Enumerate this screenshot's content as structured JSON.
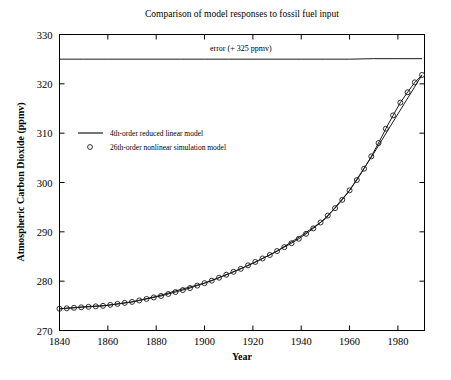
{
  "chart_data": {
    "type": "line",
    "title": "Comparison of model responses to fossil fuel input",
    "xlabel": "Year",
    "ylabel": "Atmospheric Carbon Dioxide (ppmv)",
    "xlim": [
      1840,
      1991
    ],
    "ylim": [
      270,
      330
    ],
    "xticks": [
      1840,
      1860,
      1880,
      1900,
      1920,
      1940,
      1960,
      1980
    ],
    "yticks": [
      270,
      280,
      290,
      300,
      310,
      320,
      330
    ],
    "grid": false,
    "legend_position": "upper-left-inside",
    "legend": [
      {
        "label": "4th-order reduced linear model",
        "marker": "line"
      },
      {
        "label": "26th-order nonlinear simulation model",
        "marker": "circle"
      }
    ],
    "annotations": [
      {
        "text": "error (+ 325 ppmv)",
        "x": 1915,
        "y": 326.6
      }
    ],
    "series": [
      {
        "name": "26th-order nonlinear simulation model",
        "marker": "circle",
        "x": [
          1840,
          1843,
          1846,
          1849,
          1852,
          1855,
          1858,
          1861,
          1864,
          1867,
          1870,
          1873,
          1876,
          1879,
          1882,
          1885,
          1888,
          1891,
          1894,
          1897,
          1900,
          1903,
          1906,
          1909,
          1912,
          1915,
          1918,
          1921,
          1924,
          1927,
          1930,
          1933,
          1936,
          1939,
          1942,
          1945,
          1948,
          1951,
          1954,
          1957,
          1960,
          1963,
          1966,
          1969,
          1972,
          1975,
          1978,
          1981,
          1984,
          1987,
          1990
        ],
        "y": [
          274.4,
          274.5,
          274.6,
          274.7,
          274.8,
          274.9,
          275.0,
          275.2,
          275.4,
          275.6,
          275.8,
          276.1,
          276.4,
          276.7,
          277.0,
          277.4,
          277.8,
          278.2,
          278.6,
          279.1,
          279.6,
          280.1,
          280.7,
          281.3,
          281.9,
          282.5,
          283.2,
          283.9,
          284.6,
          285.3,
          286.1,
          286.9,
          287.7,
          288.6,
          289.6,
          290.7,
          291.9,
          293.3,
          294.8,
          296.5,
          298.4,
          300.5,
          302.8,
          305.3,
          308.0,
          310.9,
          313.6,
          316.2,
          318.3,
          320.3,
          321.8
        ]
      },
      {
        "name": "4th-order reduced linear model",
        "marker": "line",
        "x": [
          1840,
          1850,
          1860,
          1870,
          1880,
          1890,
          1900,
          1910,
          1920,
          1930,
          1940,
          1950,
          1960,
          1970,
          1980,
          1990
        ],
        "y": [
          274.4,
          274.8,
          275.1,
          275.8,
          276.9,
          278.3,
          279.6,
          281.5,
          283.6,
          286.1,
          289.2,
          292.6,
          298.4,
          305.9,
          313.9,
          321.8
        ]
      },
      {
        "name": "error (+ 325 ppmv)",
        "marker": "line",
        "x": [
          1840,
          1850,
          1860,
          1870,
          1880,
          1890,
          1900,
          1910,
          1920,
          1930,
          1940,
          1950,
          1960,
          1970,
          1980,
          1990
        ],
        "y": [
          325.0,
          325.0,
          325.0,
          325.0,
          325.0,
          325.0,
          325.0,
          325.0,
          325.0,
          325.0,
          325.0,
          325.0,
          325.0,
          325.1,
          325.1,
          325.1
        ]
      }
    ]
  }
}
